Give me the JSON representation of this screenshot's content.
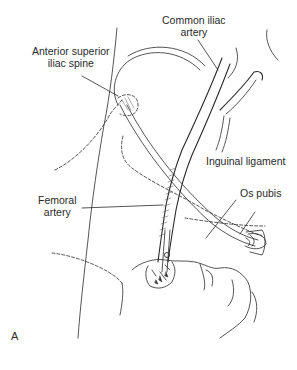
{
  "figure": {
    "panel_letter": "A",
    "labels": {
      "common_iliac_artery": [
        "Common iliac",
        "artery"
      ],
      "anterior_superior_iliac_spine": [
        "Anterior superior",
        "iliac spine"
      ],
      "inguinal_ligament": "Inguinal ligament",
      "os_pubis": "Os pubis",
      "femoral_artery": [
        "Femoral",
        "artery"
      ]
    },
    "colors": {
      "line": "#2a2a2a",
      "background": "#ffffff"
    }
  }
}
